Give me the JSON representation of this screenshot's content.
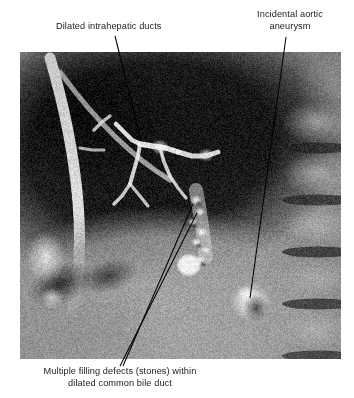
{
  "figure": {
    "name": "annotated-mrcp-scan",
    "modality_appearance": "grayscale-mr-cholangiopancreatography-sagittal",
    "frame": {
      "x": 20,
      "y": 52,
      "width": 321,
      "height": 307
    }
  },
  "annotations": [
    {
      "id": "dilated-intrahepatic-ducts",
      "text": "Dilated intrahepatic ducts",
      "lines": [
        "Dilated intrahepatic ducts"
      ],
      "align": "left",
      "text_x": 56,
      "text_y": 21,
      "leader": {
        "x1": 115,
        "y1": 36,
        "x2": 141,
        "y2": 141
      }
    },
    {
      "id": "incidental-aortic-aneurysm",
      "text": "Incidental aortic aneurysm",
      "lines": [
        "Incidental aortic",
        "aneurysm"
      ],
      "align": "center",
      "text_x": 238,
      "text_y": 9,
      "leader": {
        "x1": 286,
        "y1": 37,
        "x2": 250,
        "y2": 298
      }
    },
    {
      "id": "multiple-filling-defects",
      "text": "Multiple filling defects (stones) within dilated common bile duct",
      "lines": [
        "Multiple filling defects (stones) within",
        "dilated common bile duct"
      ],
      "align": "center",
      "text_x": 12,
      "text_y": 366,
      "leaders": [
        {
          "x1": 193,
          "y1": 204,
          "x2": 123,
          "y2": 366
        },
        {
          "x1": 197,
          "y1": 213,
          "x2": 120,
          "y2": 366
        }
      ]
    }
  ],
  "colors": {
    "page_background": "#ffffff",
    "text": "#1b1b1b",
    "leader_line": "#000000",
    "scan_midtone": "#8e8e8e",
    "scan_dark": "#1a1a1a",
    "scan_bright": "#f2f2f2"
  },
  "scan_regions": [
    {
      "name": "liver-parenchyma-dark",
      "tone": "dark"
    },
    {
      "name": "bright-fat-plane-band",
      "tone": "bright"
    },
    {
      "name": "dilated-intrahepatic-ducts",
      "tone": "bright"
    },
    {
      "name": "common-bile-duct-with-stones",
      "tone": "mixed"
    },
    {
      "name": "aortic-aneurysm",
      "tone": "bright"
    },
    {
      "name": "vertebral-bodies",
      "tone": "mid"
    },
    {
      "name": "intervertebral-discs",
      "tone": "dark"
    },
    {
      "name": "abdominal-soft-tissue",
      "tone": "mid"
    }
  ]
}
